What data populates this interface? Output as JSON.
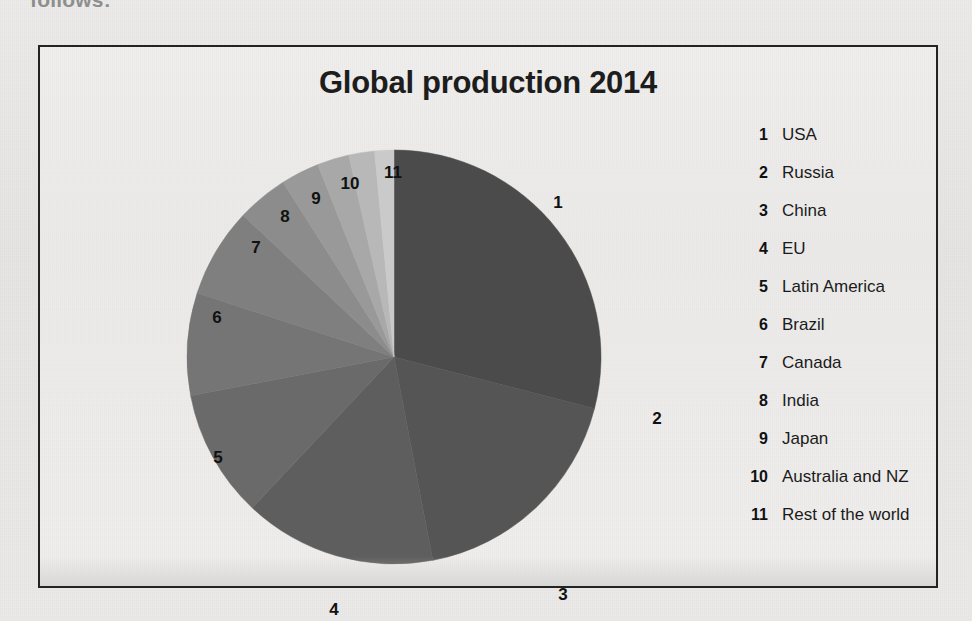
{
  "page": {
    "cutoff_text": "follows:"
  },
  "chart": {
    "title": "Global production 2014"
  },
  "legend": {
    "items": [
      {
        "num": "1",
        "label": "USA"
      },
      {
        "num": "2",
        "label": "Russia"
      },
      {
        "num": "3",
        "label": "China"
      },
      {
        "num": "4",
        "label": "EU"
      },
      {
        "num": "5",
        "label": "Latin America"
      },
      {
        "num": "6",
        "label": "Brazil"
      },
      {
        "num": "7",
        "label": "Canada"
      },
      {
        "num": "8",
        "label": "India"
      },
      {
        "num": "9",
        "label": "Japan"
      },
      {
        "num": "10",
        "label": "Australia and NZ"
      },
      {
        "num": "11",
        "label": "Rest of the world"
      }
    ]
  },
  "chart_data": {
    "type": "pie",
    "title": "Global production 2014",
    "xlabel": "",
    "ylabel": "",
    "legend_position": "right",
    "grid": false,
    "start_angle_deg": 0,
    "direction": "clockwise",
    "center": {
      "x": 354,
      "y": 310
    },
    "radius": 207,
    "labels": [
      "USA",
      "Russia",
      "China",
      "EU",
      "Latin America",
      "Brazil",
      "Canada",
      "India",
      "Japan",
      "Australia and NZ",
      "Rest of the world"
    ],
    "callout_numbers": [
      "1",
      "2",
      "3",
      "4",
      "5",
      "6",
      "7",
      "8",
      "9",
      "10",
      "11"
    ],
    "values": [
      29,
      18,
      15,
      10,
      8,
      7,
      4,
      3,
      2.5,
      2,
      1.5
    ],
    "value_unit": "percent",
    "slices": [
      {
        "num": "1",
        "label": "USA",
        "value": 29,
        "start_deg": 0.0,
        "end_deg": 104.4,
        "color": "#4b4b4b"
      },
      {
        "num": "2",
        "label": "Russia",
        "value": 18,
        "start_deg": 104.4,
        "end_deg": 169.2,
        "color": "#555555"
      },
      {
        "num": "3",
        "label": "China",
        "value": 15,
        "start_deg": 169.2,
        "end_deg": 223.2,
        "color": "#5e5e5e"
      },
      {
        "num": "4",
        "label": "EU",
        "value": 10,
        "start_deg": 223.2,
        "end_deg": 259.2,
        "color": "#6a6a6a"
      },
      {
        "num": "5",
        "label": "Latin America",
        "value": 8,
        "start_deg": 259.2,
        "end_deg": 288.0,
        "color": "#757575"
      },
      {
        "num": "6",
        "label": "Brazil",
        "value": 7,
        "start_deg": 288.0,
        "end_deg": 313.2,
        "color": "#7f7f7f"
      },
      {
        "num": "7",
        "label": "Canada",
        "value": 4,
        "start_deg": 313.2,
        "end_deg": 327.6,
        "color": "#8c8c8c"
      },
      {
        "num": "8",
        "label": "India",
        "value": 3,
        "start_deg": 327.6,
        "end_deg": 338.4,
        "color": "#999999"
      },
      {
        "num": "9",
        "label": "Japan",
        "value": 2.5,
        "start_deg": 338.4,
        "end_deg": 347.4,
        "color": "#a8a8a8"
      },
      {
        "num": "10",
        "label": "Australia and NZ",
        "value": 2,
        "start_deg": 347.4,
        "end_deg": 354.6,
        "color": "#b8b8b8"
      },
      {
        "num": "11",
        "label": "Rest of the world",
        "value": 1.5,
        "start_deg": 354.6,
        "end_deg": 360.0,
        "color": "#cacaca"
      }
    ],
    "callout_positions": [
      {
        "num": "1",
        "x": 518,
        "y": 156
      },
      {
        "num": "2",
        "x": 617,
        "y": 372
      },
      {
        "num": "3",
        "x": 523,
        "y": 548
      },
      {
        "num": "4",
        "x": 294,
        "y": 563
      },
      {
        "num": "5",
        "x": 178,
        "y": 411
      },
      {
        "num": "6",
        "x": 177,
        "y": 271
      },
      {
        "num": "7",
        "x": 216,
        "y": 201
      },
      {
        "num": "8",
        "x": 245,
        "y": 170
      },
      {
        "num": "9",
        "x": 276,
        "y": 152
      },
      {
        "num": "10",
        "x": 310,
        "y": 137
      },
      {
        "num": "11",
        "x": 353,
        "y": 126
      }
    ]
  }
}
